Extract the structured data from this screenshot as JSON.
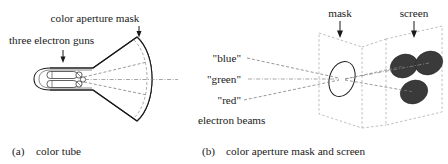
{
  "figure": {
    "panels": [
      {
        "id": "a",
        "caption_label": "(a)",
        "caption_text": "color tube",
        "annotations": [
          {
            "name": "color-aperture-mask",
            "text": "color aperture mask"
          },
          {
            "name": "three-electron-guns",
            "text": "three electron guns"
          }
        ]
      },
      {
        "id": "b",
        "caption_label": "(b)",
        "caption_text": "color aperture mask and screen",
        "annotations": [
          {
            "name": "mask",
            "text": "mask"
          },
          {
            "name": "screen",
            "text": "screen"
          },
          {
            "name": "beam-blue",
            "text": "\"blue\""
          },
          {
            "name": "beam-green",
            "text": "\"green\""
          },
          {
            "name": "beam-red",
            "text": "\"red\""
          },
          {
            "name": "electron-beams",
            "text": "electron beams"
          }
        ]
      }
    ],
    "colors": {
      "ink": "#1a1a1a",
      "phosphor_dot": "#3a3a3a",
      "plane_outline": "#b5b5b5",
      "beam_line": "#888888",
      "background": "#ffffff"
    },
    "phosphor_dots": [
      {
        "name": "dot-upper-left",
        "label": ""
      },
      {
        "name": "dot-upper-right",
        "label": ""
      },
      {
        "name": "dot-lower",
        "label": ""
      }
    ]
  }
}
